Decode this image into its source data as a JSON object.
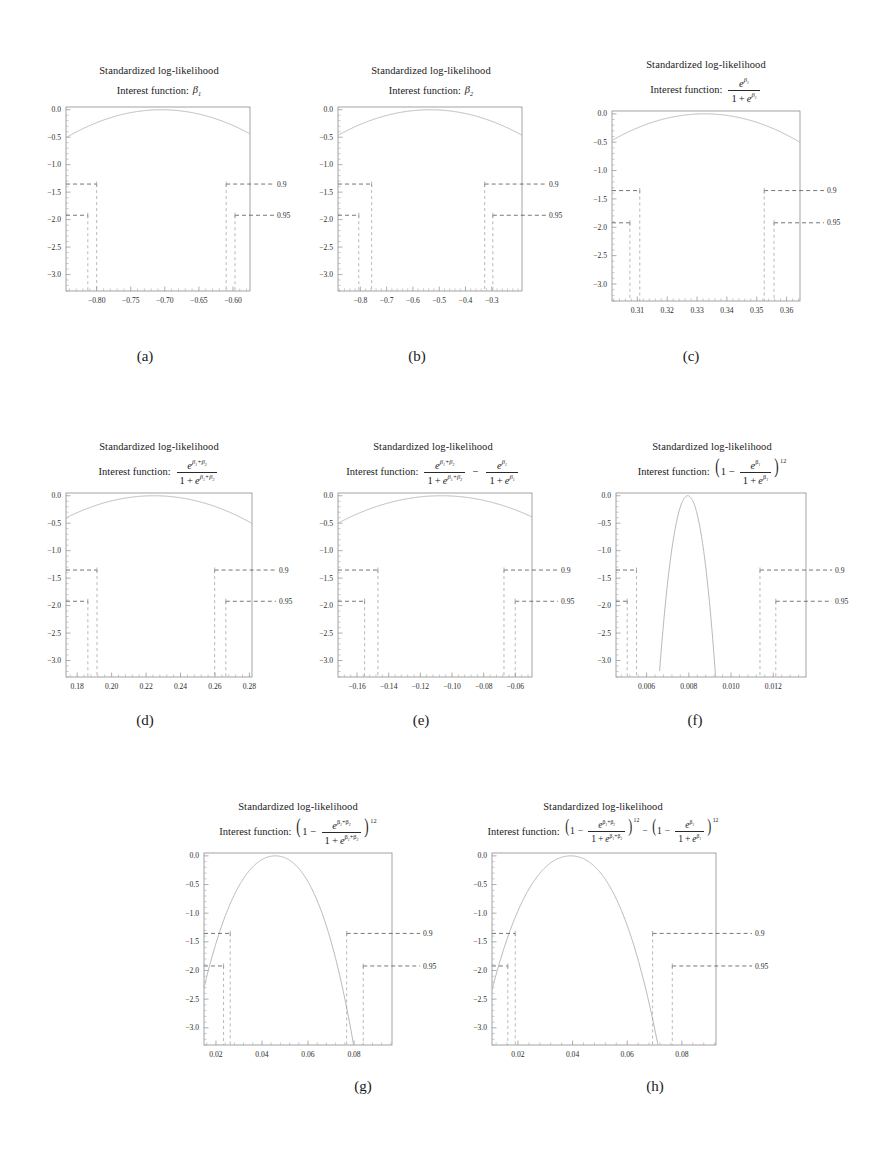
{
  "figure": {
    "title_common": "Standardized log-likelihood",
    "interest_label": "Interest function:",
    "level_labels": [
      "0.9",
      "0.95"
    ],
    "y_ticks": [
      "0.0",
      "-0.5",
      "-1.0",
      "-1.5",
      "-2.0",
      "-2.5",
      "-3.0"
    ],
    "captions": [
      "(a)",
      "(b)",
      "(c)",
      "(d)",
      "(e)",
      "(f)",
      "(g)",
      "(h)"
    ]
  },
  "chart_data": [
    {
      "id": "a",
      "type": "line",
      "title": "Standardized log-likelihood",
      "subtitle": "Interest function: β₁",
      "interest_function_tex": "\\beta_1",
      "xlabel": "",
      "ylabel": "",
      "ylim": [
        -3.3,
        0.05
      ],
      "xlim": [
        -0.845,
        -0.575
      ],
      "y_ticks": [
        0.0,
        -0.5,
        -1.0,
        -1.5,
        -2.0,
        -2.5,
        -3.0
      ],
      "x_ticks": [
        -0.8,
        -0.75,
        -0.7,
        -0.65,
        -0.6
      ],
      "x_tick_labels": [
        "-0.80",
        "-0.75",
        "-0.70",
        "-0.65",
        "-0.60"
      ],
      "mle": -0.705,
      "curvature": 52.0,
      "levels": [
        {
          "label": "0.9",
          "y": -1.353,
          "left_x": -0.8,
          "right_x": -0.61
        },
        {
          "label": "0.95",
          "y": -1.921,
          "left_x": -0.813,
          "right_x": -0.597
        }
      ],
      "grid": false,
      "legend": "right-edge level labels"
    },
    {
      "id": "b",
      "type": "line",
      "title": "Standardized log-likelihood",
      "subtitle": "Interest function: β₂",
      "interest_function_tex": "\\beta_2",
      "xlim": [
        -0.885,
        -0.185
      ],
      "ylim": [
        -3.3,
        0.05
      ],
      "y_ticks": [
        0.0,
        -0.5,
        -1.0,
        -1.5,
        -2.0,
        -2.5,
        -3.0
      ],
      "x_ticks": [
        -0.8,
        -0.7,
        -0.6,
        -0.5,
        -0.4,
        -0.3
      ],
      "x_tick_labels": [
        "-0.8",
        "-0.7",
        "-0.6",
        "-0.5",
        "-0.4",
        "-0.3"
      ],
      "mle": -0.535,
      "curvature": 7.6,
      "levels": [
        {
          "label": "0.9",
          "y": -1.353,
          "left_x": -0.757,
          "right_x": -0.327
        },
        {
          "label": "0.95",
          "y": -1.921,
          "left_x": -0.806,
          "right_x": -0.296
        }
      ],
      "grid": false
    },
    {
      "id": "c",
      "type": "line",
      "title": "Standardized log-likelihood",
      "subtitle": "Interest function: e^{β₁}/(1+e^{β₁})",
      "interest_function_tex": "\\frac{e^{\\beta_1}}{1+e^{\\beta_1}}",
      "xlim": [
        0.3015,
        0.3645
      ],
      "ylim": [
        -3.3,
        0.05
      ],
      "y_ticks": [
        0.0,
        -0.5,
        -1.0,
        -1.5,
        -2.0,
        -2.5,
        -3.0
      ],
      "x_ticks": [
        0.31,
        0.32,
        0.33,
        0.34,
        0.35,
        0.36
      ],
      "x_tick_labels": [
        "0.31",
        "0.32",
        "0.33",
        "0.34",
        "0.35",
        "0.36"
      ],
      "mle": 0.3325,
      "curvature": 980,
      "levels": [
        {
          "label": "0.9",
          "y": -1.353,
          "left_x": 0.3108,
          "right_x": 0.3525
        },
        {
          "label": "0.95",
          "y": -1.921,
          "left_x": 0.3075,
          "right_x": 0.3558
        }
      ],
      "grid": false
    },
    {
      "id": "d",
      "type": "line",
      "title": "Standardized log-likelihood",
      "subtitle": "Interest function: e^{β₁+β₂}/(1+e^{β₁+β₂})",
      "interest_function_tex": "\\frac{e^{\\beta_1+\\beta_2}}{1+e^{\\beta_1+\\beta_2}}",
      "xlim": [
        0.1735,
        0.2815
      ],
      "ylim": [
        -3.3,
        0.05
      ],
      "y_ticks": [
        0.0,
        -0.5,
        -1.0,
        -1.5,
        -2.0,
        -2.5,
        -3.0
      ],
      "x_ticks": [
        0.18,
        0.2,
        0.22,
        0.24,
        0.26,
        0.28
      ],
      "x_tick_labels": [
        "0.18",
        "0.20",
        "0.22",
        "0.24",
        "0.26",
        "0.28"
      ],
      "mle": 0.2245,
      "curvature": 310,
      "levels": [
        {
          "label": "0.9",
          "y": -1.353,
          "left_x": 0.1915,
          "right_x": 0.2598
        },
        {
          "label": "0.95",
          "y": -1.921,
          "left_x": 0.1862,
          "right_x": 0.2663
        }
      ],
      "grid": false
    },
    {
      "id": "e",
      "type": "line",
      "title": "Standardized log-likelihood",
      "subtitle": "Interest function: e^{β₁+β₂}/(1+e^{β₁+β₂}) - e^{β₁}/(1+e^{β₁})",
      "interest_function_tex": "\\frac{e^{\\beta_1+\\beta_2}}{1+e^{\\beta_1+\\beta_2}}-\\frac{e^{\\beta_1}}{1+e^{\\beta_1}}",
      "xlim": [
        -0.172,
        -0.0495
      ],
      "ylim": [
        -3.3,
        0.05
      ],
      "y_ticks": [
        0.0,
        -0.5,
        -1.0,
        -1.5,
        -2.0,
        -2.5,
        -3.0
      ],
      "x_ticks": [
        -0.16,
        -0.14,
        -0.12,
        -0.1,
        -0.08,
        -0.06
      ],
      "x_tick_labels": [
        "-0.16",
        "-0.14",
        "-0.12",
        "-0.10",
        "-0.08",
        "-0.06"
      ],
      "mle": -0.1068,
      "curvature": 235,
      "levels": [
        {
          "label": "0.9",
          "y": -1.353,
          "left_x": -0.1468,
          "right_x": -0.0672
        },
        {
          "label": "0.95",
          "y": -1.921,
          "left_x": -0.1552,
          "right_x": -0.0601
        }
      ],
      "grid": false
    },
    {
      "id": "f",
      "type": "line",
      "title": "Standardized log-likelihood",
      "subtitle": "Interest function: (1 - e^{β₁}/(1+e^{β₁}))^{12}",
      "interest_function_tex": "\\left(1-\\frac{e^{\\beta_1}}{1+e^{\\beta_1}}\\right)^{12}",
      "xlim": [
        0.00455,
        0.01355
      ],
      "ylim": [
        -3.3,
        0.05
      ],
      "y_ticks": [
        0.0,
        -0.5,
        -1.0,
        -1.5,
        -2.0,
        -2.5,
        -3.0
      ],
      "x_ticks": [
        0.006,
        0.008,
        0.01,
        0.012
      ],
      "x_tick_labels": [
        "0.006",
        "0.008",
        "0.010",
        "0.012"
      ],
      "mle": 0.00795,
      "curvature": 3200000,
      "skew": 0.55,
      "levels": [
        {
          "label": "0.9",
          "y": -1.353,
          "left_x": 0.00552,
          "right_x": 0.01137
        },
        {
          "label": "0.95",
          "y": -1.921,
          "left_x": 0.00508,
          "right_x": 0.01212
        }
      ],
      "grid": false
    },
    {
      "id": "g",
      "type": "line",
      "title": "Standardized log-likelihood",
      "subtitle": "Interest function: (1 - e^{β₁+β₂}/(1+e^{β₁+β₂}))^{12}",
      "interest_function_tex": "\\left(1-\\frac{e^{\\beta_1+\\beta_2}}{1+e^{\\beta_1+\\beta_2}}\\right)^{12}",
      "xlim": [
        0.0148,
        0.0965
      ],
      "ylim": [
        -3.3,
        0.05
      ],
      "y_ticks": [
        0.0,
        -0.5,
        -1.0,
        -1.5,
        -2.0,
        -2.5,
        -3.0
      ],
      "x_ticks": [
        0.02,
        0.04,
        0.06,
        0.08
      ],
      "x_tick_labels": [
        "0.02",
        "0.04",
        "0.06",
        "0.08"
      ],
      "mle": 0.0458,
      "curvature": 3600,
      "skew": 0.6,
      "levels": [
        {
          "label": "0.9",
          "y": -1.353,
          "left_x": 0.0262,
          "right_x": 0.0768
        },
        {
          "label": "0.95",
          "y": -1.921,
          "left_x": 0.0233,
          "right_x": 0.084
        }
      ],
      "grid": false
    },
    {
      "id": "h",
      "type": "line",
      "title": "Standardized log-likelihood",
      "subtitle": "Interest function: (1 - e^{β₁+β₂}/(1+e^{β₁+β₂}))^{12} - (1 - e^{β₁}/(1+e^{β₁}))^{12}",
      "interest_function_tex": "\\left(1-\\frac{e^{\\beta_1+\\beta_2}}{1+e^{\\beta_1+\\beta_2}}\\right)^{12}-\\left(1-\\frac{e^{\\beta_1}}{1+e^{\\beta_1}}\\right)^{12}",
      "xlim": [
        0.0105,
        0.0925
      ],
      "ylim": [
        -3.3,
        0.05
      ],
      "y_ticks": [
        0.0,
        -0.5,
        -1.0,
        -1.5,
        -2.0,
        -2.5,
        -3.0
      ],
      "x_ticks": [
        0.02,
        0.04,
        0.06,
        0.08
      ],
      "x_tick_labels": [
        "0.02",
        "0.04",
        "0.06",
        "0.08"
      ],
      "mle": 0.0393,
      "curvature": 4200,
      "skew": 0.62,
      "levels": [
        {
          "label": "0.9",
          "y": -1.353,
          "left_x": 0.019,
          "right_x": 0.0693
        },
        {
          "label": "0.95",
          "y": -1.921,
          "left_x": 0.0163,
          "right_x": 0.0765
        }
      ],
      "grid": false
    }
  ]
}
